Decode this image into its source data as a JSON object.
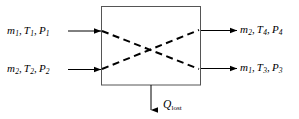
{
  "figure": {
    "type": "control-volume-heat-exchanger",
    "background_color": "#ffffff",
    "line_color": "#000000",
    "box_stroke_color": "#555555"
  },
  "control_volume": {
    "name": "control-volume-box",
    "x": 101,
    "y": 6,
    "width": 100,
    "height": 79,
    "internal_flow_pattern": "crossed-dashed-diagonals"
  },
  "streams": {
    "inlet_1": {
      "mass_flow": "m",
      "mass_flow_sub": "1",
      "temperature": "T",
      "temperature_sub": "1",
      "pressure": "P",
      "pressure_sub": "1",
      "direction": "into-control-volume",
      "side": "left-top"
    },
    "inlet_2": {
      "mass_flow": "m",
      "mass_flow_sub": "2",
      "temperature": "T",
      "temperature_sub": "2",
      "pressure": "P",
      "pressure_sub": "2",
      "direction": "into-control-volume",
      "side": "left-bottom"
    },
    "outlet_4": {
      "mass_flow": "m",
      "mass_flow_sub": "2",
      "temperature": "T",
      "temperature_sub": "4",
      "pressure": "P",
      "pressure_sub": "4",
      "direction": "out-of-control-volume",
      "side": "right-top"
    },
    "outlet_3": {
      "mass_flow": "m",
      "mass_flow_sub": "1",
      "temperature": "T",
      "temperature_sub": "3",
      "pressure": "P",
      "pressure_sub": "3",
      "direction": "out-of-control-volume",
      "side": "right-bottom"
    }
  },
  "heat_loss": {
    "symbol": "Q",
    "subscript": "lost",
    "direction": "out-of-control-volume-downward"
  },
  "punctuation": {
    "comma": ","
  }
}
